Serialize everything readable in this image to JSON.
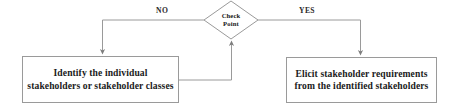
{
  "diagram": {
    "type": "flowchart",
    "background_color": "#ffffff",
    "line_color": "#9a9a9a",
    "text_color": "#1b1b1b"
  },
  "decision": {
    "name": "check-point",
    "shape": "diamond",
    "line1": "Check",
    "line2": "Point"
  },
  "branches": {
    "no": {
      "label": "NO",
      "target": "box-identify"
    },
    "yes": {
      "label": "YES",
      "target": "box-elicit"
    }
  },
  "boxes": {
    "identify": {
      "name": "identify-stakeholders-box",
      "line1": "Identify the individual",
      "line2": "stakeholders or stakeholder classes"
    },
    "elicit": {
      "name": "elicit-requirements-box",
      "line1": "Elicit stakeholder requirements",
      "line2": "from the identified stakeholders"
    }
  },
  "connectors": [
    {
      "name": "no-branch-connector",
      "from": "check-point",
      "to": "identify-stakeholders-box",
      "label": "NO",
      "arrowhead": true
    },
    {
      "name": "yes-branch-connector",
      "from": "check-point",
      "to": "elicit-requirements-box",
      "label": "YES",
      "arrowhead": true
    },
    {
      "name": "feedback-connector",
      "from": "identify-stakeholders-box",
      "to": "check-point",
      "label": "",
      "arrowhead": true
    }
  ]
}
